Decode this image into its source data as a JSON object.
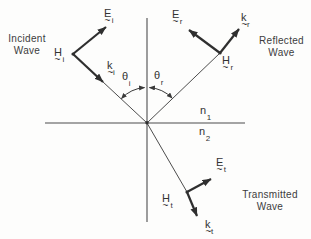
{
  "colors": {
    "background": "#fdfdfc",
    "ink": "#3a3a3a",
    "thin_line": "#4d4d4d",
    "thick_arrow": "#2f2f2f"
  },
  "wave_labels": {
    "incident": {
      "line1": "Incident",
      "line2": "Wave"
    },
    "reflected": {
      "line1": "Reflected",
      "line2": "Wave"
    },
    "transmitted": {
      "line1": "Transmitted",
      "line2": "Wave"
    }
  },
  "notation": {
    "tilde": "~"
  },
  "vectors": {
    "E_i": {
      "main": "E",
      "sub": "i"
    },
    "H_i": {
      "main": "H",
      "sub": "i"
    },
    "k_i": {
      "main": "k",
      "sub": "i"
    },
    "E_r": {
      "main": "E",
      "sub": "r"
    },
    "H_r": {
      "main": "H",
      "sub": "r"
    },
    "k_r": {
      "main": "k",
      "sub": "r"
    },
    "E_t": {
      "main": "E",
      "sub": "t"
    },
    "H_t": {
      "main": "H",
      "sub": "t"
    },
    "k_t": {
      "main": "k",
      "sub": "t"
    }
  },
  "angles": {
    "theta_i": {
      "symbol": "θ",
      "sub": "i"
    },
    "theta_r": {
      "symbol": "θ",
      "sub": "r"
    }
  },
  "media": {
    "n1": {
      "main": "n",
      "sub": "1"
    },
    "n2": {
      "main": "n",
      "sub": "2"
    }
  }
}
